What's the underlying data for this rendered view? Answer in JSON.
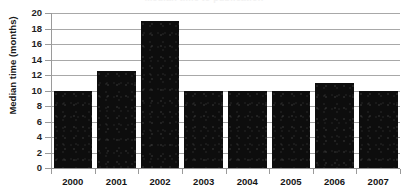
{
  "chart_data": {
    "type": "bar",
    "title": "Median time to publication",
    "xlabel": "",
    "ylabel": "Median time (months)",
    "categories": [
      "2000",
      "2001",
      "2002",
      "2003",
      "2004",
      "2005",
      "2006",
      "2007"
    ],
    "values": [
      10,
      12.5,
      19,
      10,
      10,
      10,
      11,
      10
    ],
    "ylim": [
      0,
      20
    ],
    "ytick_step": 2,
    "yticks": [
      0,
      2,
      4,
      6,
      8,
      10,
      12,
      14,
      16,
      18,
      20
    ],
    "ytick_labels": [
      "0",
      "2",
      "4",
      "6",
      "8",
      "10",
      "12",
      "14",
      "16",
      "18",
      "20"
    ],
    "grid": true,
    "grid_axis": "y",
    "legend": false,
    "legend_position": "none",
    "series": [
      {
        "name": "Median time (months)",
        "values": [
          10,
          12.5,
          19,
          10,
          10,
          10,
          11,
          10
        ],
        "color": "#0d0d0d"
      }
    ]
  },
  "style": {
    "bar_color": "#0d0d0d",
    "gridline_color": "#a8a8a8",
    "axis_color": "#8f8f8f",
    "text_color": "#1a1a1a",
    "background": "#ffffff"
  }
}
